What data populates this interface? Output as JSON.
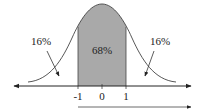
{
  "diagram": {
    "type": "normal-distribution",
    "center_label": "68%",
    "left_tail_label": "16%",
    "right_tail_label": "16%",
    "ticks": [
      "-1",
      "0",
      "1"
    ],
    "colors": {
      "shade": "#a9a9a9",
      "line": "#222222"
    }
  }
}
